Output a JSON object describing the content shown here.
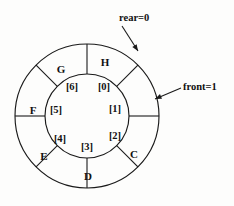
{
  "figure": {
    "type": "circular-queue-diagram",
    "background_color": "#fdfdfc",
    "stroke_color": "#1a1a1a",
    "geometry": {
      "center_x": 87,
      "center_y": 116,
      "outer_radius": 72,
      "inner_radius": 42,
      "sector_count": 8,
      "sector_degrees": 45,
      "first_boundary_angle_deg": 0
    }
  },
  "slots": [
    {
      "index_label": "[0]",
      "letter_label": "H",
      "sector": 0,
      "letter_x": 105,
      "letter_y": 63,
      "index_x": 104,
      "index_y": 88
    },
    {
      "index_label": "[1]",
      "letter_label": "",
      "sector": 1,
      "letter_x": 135,
      "letter_y": 92,
      "index_x": 115,
      "index_y": 110
    },
    {
      "index_label": "[2]",
      "letter_label": "C",
      "sector": 2,
      "letter_x": 134,
      "letter_y": 155,
      "index_x": 115,
      "index_y": 137
    },
    {
      "index_label": "[3]",
      "letter_label": "D",
      "sector": 3,
      "letter_x": 88,
      "letter_y": 177,
      "index_x": 87,
      "index_y": 148
    },
    {
      "index_label": "[4]",
      "letter_label": "E",
      "sector": 4,
      "letter_x": 44,
      "letter_y": 157,
      "index_x": 60,
      "index_y": 140
    },
    {
      "index_label": "[5]",
      "letter_label": "F",
      "sector": 5,
      "letter_x": 33,
      "letter_y": 111,
      "index_x": 56,
      "index_y": 111
    },
    {
      "index_label": "[6]",
      "letter_label": "G",
      "sector": 6,
      "letter_x": 61,
      "letter_y": 70,
      "index_x": 72,
      "index_y": 88
    },
    {
      "index_label": "[7]",
      "letter_label": "",
      "sector": 7,
      "letter_x": 0,
      "letter_y": 0,
      "index_x": 0,
      "index_y": 0
    }
  ],
  "annotations": [
    {
      "id": "rear",
      "text": "rear=0",
      "text_x": 119,
      "text_y": 19,
      "align": "start",
      "leader": {
        "x1": 122,
        "y1": 26,
        "x2": 138,
        "y2": 51
      },
      "arrow_angle_deg": 57
    },
    {
      "id": "front",
      "text": "front=1",
      "text_x": 183,
      "text_y": 88,
      "align": "start",
      "leader": {
        "x1": 181,
        "y1": 88,
        "x2": 155,
        "y2": 99
      },
      "arrow_angle_deg": 203
    }
  ]
}
